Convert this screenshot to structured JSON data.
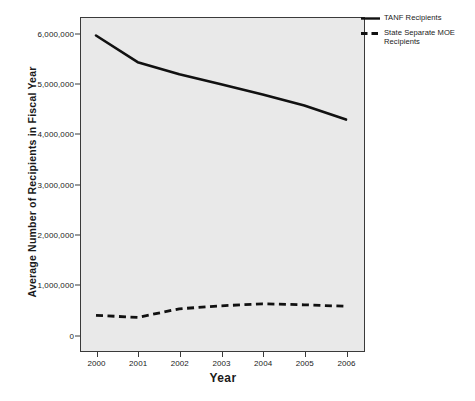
{
  "chart_data": {
    "type": "line",
    "title": "",
    "xlabel": "Year",
    "ylabel": "Average Number of Recipients in Fiscal Year",
    "x": [
      2000,
      2001,
      2002,
      2003,
      2004,
      2005,
      2006
    ],
    "xtick_labels": [
      "2000",
      "2001",
      "2002",
      "2003",
      "2004",
      "2005",
      "2006"
    ],
    "ytick_labels": [
      "0",
      "1,000,000",
      "2,000,000",
      "3,000,000",
      "4,000,000",
      "5,000,000",
      "6,000,000"
    ],
    "ytick_values": [
      0,
      1000000,
      2000000,
      3000000,
      4000000,
      5000000,
      6000000
    ],
    "xlim": [
      2000,
      2006
    ],
    "ylim": [
      0,
      6300000
    ],
    "grid": false,
    "legend_position": "right-outside",
    "series": [
      {
        "name": "TANF Recipients",
        "style": "solid",
        "color": "#111111",
        "values": [
          5950000,
          5420000,
          5180000,
          4980000,
          4780000,
          4560000,
          4280000
        ]
      },
      {
        "name": "State Separate MOE Recipients",
        "style": "dashed",
        "color": "#111111",
        "values": [
          390000,
          350000,
          520000,
          580000,
          620000,
          600000,
          570000
        ]
      }
    ]
  },
  "legend": {
    "entries": [
      {
        "label": "TANF Recipients",
        "swatch": "solid-line-swatch"
      },
      {
        "label": "State Separate MOE Recipients",
        "swatch": "dashed-line-swatch"
      }
    ]
  },
  "colors": {
    "plot_background": "#e9e9e9",
    "axis": "#3a3a3a",
    "series_line": "#111111",
    "page_background": "#ffffff"
  }
}
